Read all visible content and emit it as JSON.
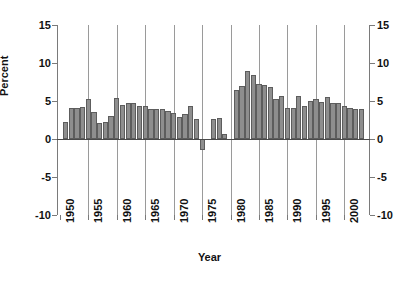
{
  "chart_data": {
    "type": "bar",
    "title": "",
    "xlabel": "Year",
    "ylabel": "Percent",
    "ylim": [
      -10,
      15
    ],
    "yticks": [
      -10,
      -5,
      0,
      5,
      10,
      15
    ],
    "ytick_labels_left": [
      "-10",
      "-5",
      "0",
      "5",
      "10",
      "15"
    ],
    "ytick_labels_right": [
      "-10",
      "-5",
      "0",
      "5",
      "10",
      "15"
    ],
    "xlim": [
      1949.5,
      2004.5
    ],
    "xticks": [
      1950,
      1955,
      1960,
      1965,
      1970,
      1975,
      1980,
      1985,
      1990,
      1995,
      2000
    ],
    "xtick_labels": [
      "1950",
      "1955",
      "1960",
      "1965",
      "1970",
      "1975",
      "1980",
      "1985",
      "1990",
      "1995",
      "2000"
    ],
    "gridlines": {
      "vertical_at": [
        1955,
        1960,
        1965,
        1970,
        1975,
        1980,
        1985,
        1990,
        1995,
        2000
      ],
      "horizontal": false
    },
    "legend": null,
    "bar_color": "#8e8e8e",
    "bar_edge_color": "#5d5d5d",
    "axis_color": "#7a7a7a",
    "categories": [
      "1951",
      "1952",
      "1953",
      "1954",
      "1955",
      "1956",
      "1957",
      "1958",
      "1959",
      "1960",
      "1961",
      "1962",
      "1963",
      "1964",
      "1965",
      "1966",
      "1967",
      "1968",
      "1969",
      "1970",
      "1971",
      "1972",
      "1973",
      "1974",
      "1975",
      "1976",
      "1977",
      "1978",
      "1979",
      "1980",
      "1981",
      "1982",
      "1983",
      "1984",
      "1985",
      "1986",
      "1987",
      "1988",
      "1989",
      "1990",
      "1991",
      "1992",
      "1993",
      "1994",
      "1995",
      "1996",
      "1997",
      "1998",
      "1999",
      "2000",
      "2001",
      "2002",
      "2003"
    ],
    "values": [
      2.2,
      4.1,
      4.1,
      4.2,
      5.2,
      3.5,
      2.1,
      2.2,
      3.0,
      5.4,
      4.5,
      4.8,
      4.7,
      4.4,
      4.3,
      4.0,
      4.0,
      4.0,
      3.7,
      3.4,
      2.9,
      3.3,
      4.4,
      2.6,
      -1.5,
      0.0,
      2.6,
      2.7,
      0.6,
      0.0,
      6.5,
      7.0,
      8.9,
      8.4,
      7.3,
      7.1,
      6.8,
      5.2,
      5.6,
      4.1,
      4.1,
      5.6,
      4.4,
      5.0,
      5.2,
      4.9,
      5.5,
      4.7,
      4.7,
      4.4,
      4.1,
      4.0,
      3.9
    ]
  }
}
